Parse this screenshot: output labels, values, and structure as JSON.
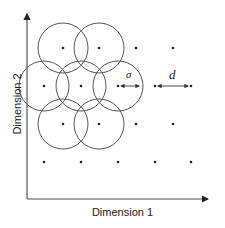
{
  "diagram": {
    "x_axis_label": "Dimension 1",
    "y_axis_label": "Dimension 2",
    "sigma_label": "σ",
    "d_label": "d",
    "colors": {
      "line": "#555555",
      "dot": "#222222",
      "text": "#222222"
    },
    "grid_points": [
      [
        63,
        48
      ],
      [
        99,
        48
      ],
      [
        136,
        48
      ],
      [
        173,
        48
      ],
      [
        44,
        86
      ],
      [
        81,
        86
      ],
      [
        118,
        86
      ],
      [
        155,
        86
      ],
      [
        191,
        86
      ],
      [
        63,
        124
      ],
      [
        99,
        124
      ],
      [
        136,
        124
      ],
      [
        173,
        124
      ],
      [
        44,
        162
      ],
      [
        81,
        162
      ],
      [
        118,
        162
      ],
      [
        155,
        162
      ],
      [
        191,
        162
      ]
    ],
    "circles": [
      {
        "cx": 63,
        "cy": 48,
        "r": 25
      },
      {
        "cx": 99,
        "cy": 48,
        "r": 25
      },
      {
        "cx": 44,
        "cy": 86,
        "r": 25
      },
      {
        "cx": 81,
        "cy": 86,
        "r": 25
      },
      {
        "cx": 118,
        "cy": 86,
        "r": 25
      },
      {
        "cx": 63,
        "cy": 124,
        "r": 25
      },
      {
        "cx": 99,
        "cy": 124,
        "r": 25
      }
    ]
  }
}
